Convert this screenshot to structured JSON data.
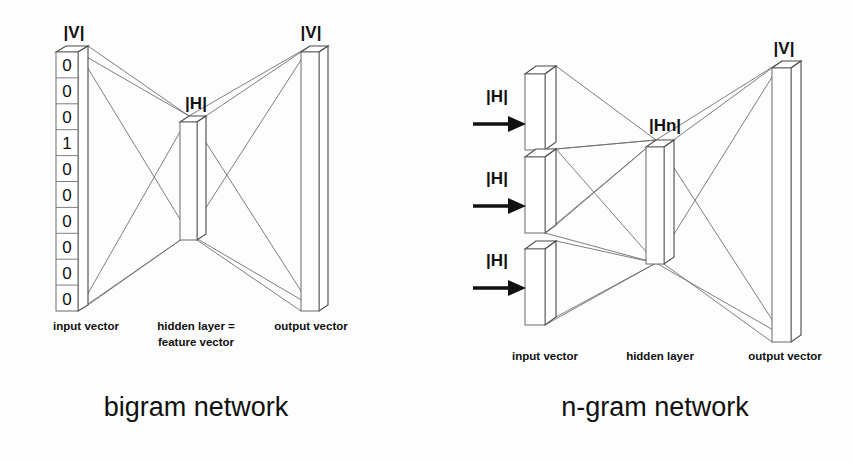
{
  "figure": {
    "background_color": "#fdfdfd",
    "line_color": "#707070",
    "text_color": "#111111",
    "width": 853,
    "height": 462
  },
  "panels": [
    {
      "id": "bigram",
      "title": "bigram network",
      "title_x": 196,
      "title_y": 416,
      "layers": {
        "input": {
          "dim_label": "|V|",
          "dim_label_x": 74,
          "dim_label_y": 38,
          "caption": "input vector",
          "caption_x": 86,
          "caption_y": 330,
          "box": {
            "x": 56,
            "y": 52,
            "w": 22,
            "h": 259,
            "depth_x": 10,
            "depth_y": -6
          },
          "cells": [
            "0",
            "0",
            "0",
            "1",
            "0",
            "0",
            "0",
            "0",
            "0",
            "0"
          ]
        },
        "hidden": {
          "dim_label": "|H|",
          "dim_label_x": 196,
          "dim_label_y": 109,
          "caption_line1": "hidden layer =",
          "caption_line2": "feature vector",
          "caption_x": 196,
          "caption_y1": 330,
          "caption_y2": 346,
          "box": {
            "x": 180,
            "y": 122,
            "w": 17,
            "h": 118,
            "depth_x": 9,
            "depth_y": -6
          }
        },
        "output": {
          "dim_label": "|V|",
          "dim_label_x": 311,
          "dim_label_y": 38,
          "caption": "output vector",
          "caption_x": 311,
          "caption_y": 330,
          "box": {
            "x": 301,
            "y": 52,
            "w": 18,
            "h": 259,
            "depth_x": 9,
            "depth_y": -6
          }
        }
      }
    },
    {
      "id": "ngram",
      "title": "n-gram network",
      "title_x": 655,
      "title_y": 416,
      "layers": {
        "input": {
          "caption": "input vector",
          "caption_x": 545,
          "caption_y": 360,
          "arrow_labels": [
            "|H|",
            "|H|",
            "|H|"
          ],
          "arrows": [
            {
              "label_x": 497,
              "label_y": 102,
              "shaft_x1": 473,
              "shaft_x2": 516,
              "y": 124
            },
            {
              "label_x": 497,
              "label_y": 184,
              "shaft_x1": 473,
              "shaft_x2": 516,
              "y": 206
            },
            {
              "label_x": 497,
              "label_y": 266,
              "shaft_x1": 473,
              "shaft_x2": 516,
              "y": 288
            }
          ],
          "boxes": [
            {
              "x": 525,
              "y": 74,
              "w": 20,
              "h": 76,
              "depth_x": 11,
              "depth_y": -8
            },
            {
              "x": 525,
              "y": 157,
              "w": 20,
              "h": 76,
              "depth_x": 11,
              "depth_y": -8
            },
            {
              "x": 525,
              "y": 249,
              "w": 20,
              "h": 76,
              "depth_x": 11,
              "depth_y": -8
            }
          ]
        },
        "hidden": {
          "dim_label": "|Hn|",
          "dim_label_x": 665,
          "dim_label_y": 131,
          "caption": "hidden layer",
          "caption_x": 660,
          "caption_y": 360,
          "box": {
            "x": 646,
            "y": 147,
            "w": 18,
            "h": 117,
            "depth_x": 10,
            "depth_y": -7
          }
        },
        "output": {
          "dim_label": "|V|",
          "dim_label_x": 784,
          "dim_label_y": 54,
          "caption": "output vector",
          "caption_x": 785,
          "caption_y": 360,
          "box": {
            "x": 772,
            "y": 68,
            "w": 19,
            "h": 274,
            "depth_x": 10,
            "depth_y": -7
          }
        }
      }
    }
  ],
  "icons": {
    "arrow": "right-arrow-icon"
  }
}
